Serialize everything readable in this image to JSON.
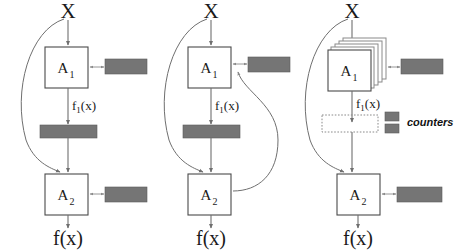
{
  "figure": {
    "background_color": "#ffffff",
    "gray_color": "#757575",
    "line_color": "#6f6f6f",
    "box_stroke_color": "#4a4a4a"
  },
  "labels": {
    "input": "X",
    "output": "f(x)",
    "stage1": "A",
    "stage1_sub": "1",
    "stage2": "A",
    "stage2_sub": "2",
    "intermediate": "f",
    "intermediate_sub": "1",
    "intermediate_tail": "(x)",
    "legend_counters": "counters"
  },
  "panels": [
    {
      "id": "panel-left",
      "name": "baseline-variant",
      "input_label": "X",
      "output_label": "f(x)",
      "stage1_label": "A",
      "stage1_subscript": "1",
      "stage2_label": "A",
      "stage2_subscript": "2",
      "intermediate_label": "f1(x)",
      "has_counter_stage1": true,
      "has_counter_stage2": true,
      "has_gray_bar": true,
      "has_dotted_box": false,
      "has_stacked_boxes": false,
      "has_feedback_curve": false,
      "has_bypass_curve": true
    },
    {
      "id": "panel-middle",
      "name": "feedback-variant",
      "input_label": "X",
      "output_label": "f(x)",
      "stage1_label": "A",
      "stage1_subscript": "1",
      "stage2_label": "A",
      "stage2_subscript": "2",
      "intermediate_label": "f1(x)",
      "has_counter_stage1": true,
      "has_counter_stage2": false,
      "has_gray_bar": true,
      "has_dotted_box": false,
      "has_stacked_boxes": false,
      "has_feedback_curve": true,
      "has_bypass_curve": true
    },
    {
      "id": "panel-right",
      "name": "ensemble-variant",
      "input_label": "X",
      "output_label": "f(x)",
      "stage1_label": "A",
      "stage1_subscript": "1",
      "stage2_label": "A",
      "stage2_subscript": "2",
      "intermediate_label": "f1(x)",
      "has_counter_stage1": true,
      "has_counter_stage2": true,
      "has_gray_bar": false,
      "has_dotted_box": true,
      "has_stacked_boxes": true,
      "has_feedback_curve": false,
      "has_bypass_curve": true,
      "legend_label": "counters",
      "legend_swatch_count": 2
    }
  ]
}
